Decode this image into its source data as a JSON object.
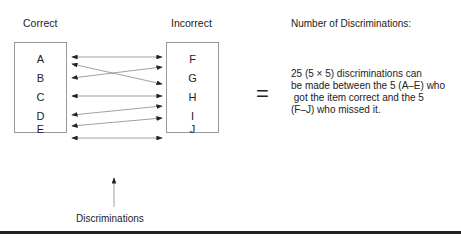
{
  "left_column": {
    "title": "Correct",
    "items": [
      "A",
      "B",
      "C",
      "D",
      "E"
    ]
  },
  "right_column": {
    "title": "Incorrect",
    "items": [
      "F",
      "G",
      "H",
      "I",
      "J"
    ]
  },
  "arrows_label": "Discriminations",
  "equals_sign": "=",
  "result": {
    "title": "Number of Discriminations:",
    "lines": [
      "25 (5 × 5) discriminations can",
      "be made between the 5 (A–E) who",
      " got the item correct and the 5",
      "(F–J) who missed it."
    ]
  },
  "connections": [
    {
      "from": "A",
      "to": "F"
    },
    {
      "from": "A",
      "to": "H"
    },
    {
      "from": "B",
      "to": "G"
    },
    {
      "from": "C",
      "to": "H"
    },
    {
      "from": "D",
      "to": "I"
    },
    {
      "from": "E",
      "to": "I"
    },
    {
      "from": "E",
      "to": "J"
    }
  ]
}
